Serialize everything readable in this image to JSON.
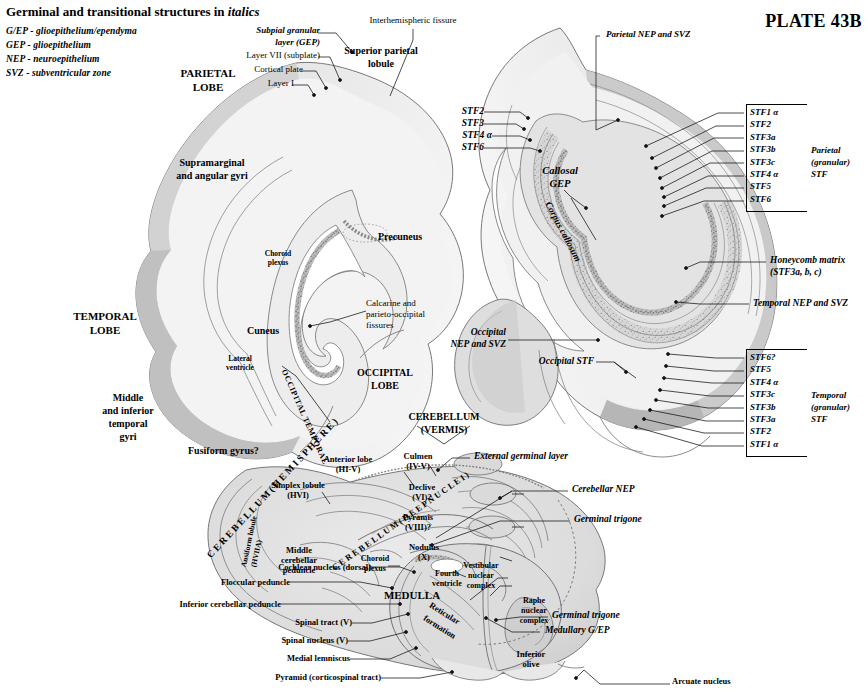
{
  "plate": {
    "number_label": "PLATE 43B",
    "legend_title": "Germinal and transitional structures in italics",
    "legend_title_plain": "Germinal and transitional structures in",
    "legend_title_italic": "italics",
    "legend_items": [
      "G/EP - glioepithelium/ependyma",
      "GEP - glioepithelium",
      "NEP - neuroepithelium",
      "SVZ - subventricular zone"
    ]
  },
  "colors": {
    "ink": "#000000",
    "tissue_light": "#f0f0f0",
    "tissue_mid": "#e2e2e2",
    "tissue_dark": "#c9c9c9",
    "band_dark": "#a9a9a9",
    "band_darker": "#8f8f8f",
    "outline": "#555555",
    "leader": "#1a1a1a"
  },
  "top_labels": {
    "subpial_granular_layer": "Subpial granular\nlayer (GEP)",
    "subpial_line1": "Subpial granular",
    "subpial_line2": "layer (GEP)",
    "layer_vii": "Layer VII (subplate)",
    "cortical_plate": "Cortical plate",
    "layer_i": "Layer I",
    "interhemispheric_fissure": "Interhemispheric fissure",
    "superior_parietal_lobule_l1": "Superior parietal",
    "superior_parietal_lobule_l2": "lobule",
    "parietal_nep_svz": "Parietal NEP and SVZ"
  },
  "left_hemisphere": {
    "parietal_lobe_l1": "PARIETAL",
    "parietal_lobe_l2": "LOBE",
    "supramarginal_l1": "Supramarginal",
    "supramarginal_l2": "and angular gyri",
    "choroid_plexus_l1": "Choroid",
    "choroid_plexus_l2": "plexus",
    "precuneus": "Precuneus",
    "calcarine_l1": "Calcarine and",
    "calcarine_l2": "parieto-occipital",
    "calcarine_l3": "fissures",
    "temporal_lobe_l1": "TEMPORAL",
    "temporal_lobe_l2": "LOBE",
    "cuneus": "Cuneus",
    "lateral_ventricle_l1": "Lateral",
    "lateral_ventricle_l2": "ventricle",
    "occipital_lobe_l1": "OCCIPITAL",
    "occipital_lobe_l2": "LOBE",
    "middle_inferior_l1": "Middle",
    "middle_inferior_l2": "and inferior",
    "middle_inferior_l3": "temporal",
    "middle_inferior_l4": "gyri",
    "fusiform_gyrus": "Fusiform gyrus?",
    "occipital_temporal_rot": "OCCIPITAL TEMPORAL",
    "cerebellum_hemisphere_rot": "C E R E B E L L U M  ( H E M I S P H E R E )"
  },
  "right_hemisphere": {
    "stf2": "STF2",
    "stf3": "STF3",
    "stf4a": "STF4 α",
    "stf6": "STF6",
    "callosal_gep_l1": "Callosal",
    "callosal_gep_l2": "GEP",
    "corpus_callosum": "Corpus callosum",
    "honeycomb_l1": "Honeycomb matrix",
    "honeycomb_l2": "(STF3a, b, c)",
    "temporal_nep_svz": "Temporal NEP and SVZ",
    "occipital_nep_svz_l1": "Occipital",
    "occipital_nep_svz_l2": "NEP and SVZ",
    "occipital_stf": "Occipital STF"
  },
  "parietal_stf": {
    "group_l1": "Parietal",
    "group_l2": "(granular)",
    "group_l3": "STF",
    "rows": [
      "STF1 α",
      "STF2",
      "STF3a",
      "STF3b",
      "STF3c",
      "STF4 α",
      "STF5",
      "STF6"
    ]
  },
  "temporal_stf": {
    "group_l1": "Temporal",
    "group_l2": "(granular)",
    "group_l3": "STF",
    "rows": [
      "STF6?",
      "STF5",
      "STF4 α",
      "STF3c",
      "STF3b",
      "STF3a",
      "STF2",
      "STF1 α"
    ]
  },
  "cerebellum": {
    "vermis_l1": "CEREBELLUM",
    "vermis_l2": "(VERMIS)",
    "anterior_lobe_l1": "Anterior lobe",
    "anterior_lobe_l2": "(HI-V)",
    "simplex_l1": "Simplex lobule",
    "simplex_l2": "(HVI)",
    "culmen_l1": "Culmen",
    "culmen_l2": "(IV-V)",
    "declive_l1": "Declive",
    "declive_l2": "(VI)?",
    "pyramis_l1": "Pyramis",
    "pyramis_l2": "(VIII)?",
    "nodulus_l1": "Nodulus",
    "nodulus_l2": "(X)",
    "ansiform_rot_l1": "Ansiform lobule",
    "ansiform_rot_l2": "(HVIIA)",
    "deep_nuclei_rot": "C E R E B E L L U M  ( D E E P  N U C L E I )",
    "middle_peduncle_l1": "Middle",
    "middle_peduncle_l2": "cerebellar",
    "middle_peduncle_l3": "peduncle",
    "choroid_plexus_l1": "Choroid",
    "choroid_plexus_l2": "plexus",
    "cochlear_nucleus": "Cochlear nucleus (dorsal)",
    "floccular_peduncle": "Floccular peduncle",
    "inferior_cerebellar_peduncle": "Inferior cerebellar peduncle",
    "fourth_ventricle_l1": "Fourth",
    "fourth_ventricle_l2": "ventricle",
    "vestibular_l1": "Vestibular",
    "vestibular_l2": "nuclear",
    "vestibular_l3": "complex"
  },
  "medulla": {
    "title": "MEDULLA",
    "spinal_tract": "Spinal tract (V)",
    "spinal_nucleus": "Spinal nucleus (V)",
    "medial_lemniscus": "Medial lemniscus",
    "pyramid": "Pyramid (corticospinal tract)",
    "reticular_rot_l1": "Reticular",
    "reticular_rot_l2": "formation",
    "raphe_l1": "Raphe",
    "raphe_l2": "nuclear",
    "raphe_l3": "complex",
    "inferior_olive_l1": "Inferior",
    "inferior_olive_l2": "olive",
    "arcuate_nucleus": "Arcuate nucleus"
  },
  "germinal_labels": {
    "external_germinal_layer": "External germinal layer",
    "cerebellar_nep": "Cerebellar NEP",
    "germinal_trigone_upper": "Germinal trigone",
    "germinal_trigone_lower": "Germinal trigone",
    "medullary_gep": "Medullary G/EP"
  }
}
